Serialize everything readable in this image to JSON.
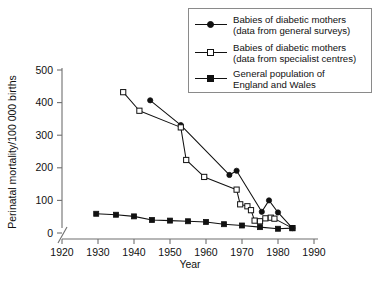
{
  "chart_data": {
    "type": "line",
    "title": "",
    "xlabel": "Year",
    "ylabel": "Perinatal mortality/100 000 births",
    "xlim": [
      1920,
      1990
    ],
    "ylim": [
      0,
      500
    ],
    "xticks": [
      1920,
      1930,
      1940,
      1950,
      1960,
      1970,
      1980,
      1990
    ],
    "yticks": [
      0,
      100,
      200,
      300,
      400,
      500
    ],
    "grid": false,
    "axis_break": "y-axis break near origin",
    "legend_position": "top-right",
    "series": [
      {
        "name": "Babies of diabetic mothers (data from general surveys)",
        "legend_label_line1": "Babies of diabetic mothers",
        "legend_label_line2": "(data from general surveys)",
        "marker": "filled-circle",
        "points": [
          {
            "x": 1944.5,
            "y": 407
          },
          {
            "x": 1953.0,
            "y": 331
          },
          {
            "x": 1966.5,
            "y": 178
          },
          {
            "x": 1968.5,
            "y": 191
          },
          {
            "x": 1975.5,
            "y": 65
          },
          {
            "x": 1977.5,
            "y": 100
          },
          {
            "x": 1980.0,
            "y": 63
          },
          {
            "x": 1984.0,
            "y": 15
          }
        ]
      },
      {
        "name": "Babies of diabetic mothers (data from specialist centres)",
        "legend_label_line1": "Babies of diabetic mothers",
        "legend_label_line2": "(data from specialist centres)",
        "marker": "open-square",
        "points": [
          {
            "x": 1937.0,
            "y": 432
          },
          {
            "x": 1941.5,
            "y": 375
          },
          {
            "x": 1953.0,
            "y": 324
          },
          {
            "x": 1954.5,
            "y": 224
          },
          {
            "x": 1959.5,
            "y": 172
          },
          {
            "x": 1968.5,
            "y": 133
          },
          {
            "x": 1969.5,
            "y": 88
          },
          {
            "x": 1971.5,
            "y": 82
          },
          {
            "x": 1972.5,
            "y": 70
          },
          {
            "x": 1973.5,
            "y": 38
          },
          {
            "x": 1975.0,
            "y": 36
          },
          {
            "x": 1976.5,
            "y": 45
          },
          {
            "x": 1978.0,
            "y": 47
          },
          {
            "x": 1979.0,
            "y": 44
          },
          {
            "x": 1984.0,
            "y": 15
          }
        ]
      },
      {
        "name": "General population of England and Wales",
        "legend_label_line1": "General population of",
        "legend_label_line2": "England and Wales",
        "marker": "filled-square",
        "points": [
          {
            "x": 1929.5,
            "y": 59
          },
          {
            "x": 1935.0,
            "y": 56
          },
          {
            "x": 1940.0,
            "y": 51
          },
          {
            "x": 1945.0,
            "y": 40
          },
          {
            "x": 1950.0,
            "y": 38
          },
          {
            "x": 1955.0,
            "y": 36
          },
          {
            "x": 1960.0,
            "y": 34
          },
          {
            "x": 1965.0,
            "y": 27
          },
          {
            "x": 1970.0,
            "y": 23
          },
          {
            "x": 1975.0,
            "y": 18
          },
          {
            "x": 1980.0,
            "y": 13
          },
          {
            "x": 1984.0,
            "y": 15
          }
        ]
      }
    ]
  },
  "axes": {
    "y_title": "Perinatal mortality/100 000 births",
    "x_title": "Year",
    "y_tick_labels": [
      "0",
      "100",
      "200",
      "300",
      "400",
      "500"
    ],
    "x_tick_labels": [
      "1920",
      "1930",
      "1940",
      "1950",
      "1960",
      "1970",
      "1980",
      "1990"
    ]
  },
  "legend": {
    "items": [
      {
        "marker": "filled-circle",
        "line1": "Babies of diabetic mothers",
        "line2": "(data from general surveys)"
      },
      {
        "marker": "open-square",
        "line1": "Babies of diabetic mothers",
        "line2": "(data from specialist centres)"
      },
      {
        "marker": "filled-square",
        "line1": "General population of",
        "line2": "England and Wales"
      }
    ]
  },
  "colors": {
    "ink": "#111111",
    "axis": "#6f6f6f",
    "background": "#ffffff",
    "legend_border": "#8a8a8a"
  }
}
